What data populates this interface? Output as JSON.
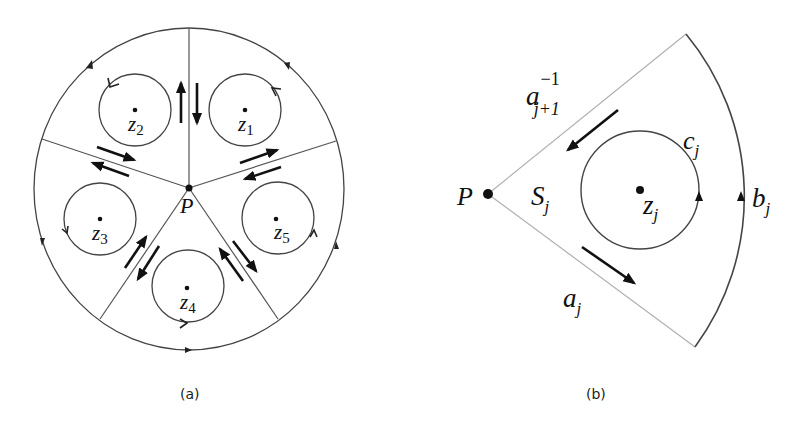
{
  "figure": {
    "panel_a": {
      "caption": "(a)",
      "center_label": "P",
      "points": [
        {
          "letter": "z",
          "sub": "1"
        },
        {
          "letter": "z",
          "sub": "2"
        },
        {
          "letter": "z",
          "sub": "3"
        },
        {
          "letter": "z",
          "sub": "4"
        },
        {
          "letter": "z",
          "sub": "5"
        }
      ]
    },
    "panel_b": {
      "caption": "(b)",
      "vertex_label": "P",
      "region_label": {
        "letter": "S",
        "sub": "j"
      },
      "point_label": {
        "letter": "z",
        "sub": "j"
      },
      "circle_label": {
        "letter": "c",
        "sub": "j"
      },
      "arc_label": {
        "letter": "b",
        "sub": "j"
      },
      "lower_edge_label": {
        "letter": "a",
        "sub": "j"
      },
      "upper_edge_label": {
        "letter": "a",
        "sub": "j+1",
        "sup": "−1"
      }
    },
    "colors": {
      "stroke": "#333333",
      "light_stroke": "#b0b0b0",
      "arrow": "#111111"
    }
  }
}
